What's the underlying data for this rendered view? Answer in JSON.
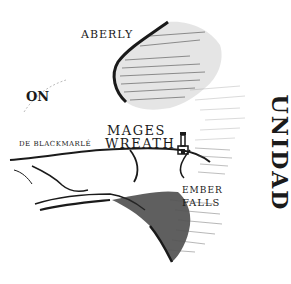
{
  "map": {
    "title": "Regional hand-drawn map",
    "labels": {
      "aberly": "ABERLY",
      "partial_left": "ON",
      "blackmarle": "DE BLACKMARLÉ",
      "mages": "MAGES",
      "wreath": "WREATH",
      "ember": "EMBER",
      "falls": "FALLS",
      "vertical_right": "UNIDAD"
    },
    "icons": {
      "tower": "tower-icon"
    },
    "colors": {
      "ink": "#1a1a1a",
      "hatch": "#555555",
      "paper": "#ffffff"
    }
  }
}
